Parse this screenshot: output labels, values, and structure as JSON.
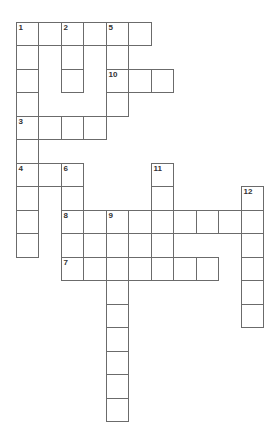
{
  "puzzle": {
    "origin": {
      "x": 16,
      "y": 22
    },
    "cell_w": 22.5,
    "cell_h": 23.5,
    "border_color": "#6b6b6b",
    "cells": [
      [
        0,
        0,
        "1"
      ],
      [
        0,
        1,
        ""
      ],
      [
        0,
        2,
        "2"
      ],
      [
        0,
        3,
        ""
      ],
      [
        0,
        4,
        "5"
      ],
      [
        0,
        5,
        ""
      ],
      [
        1,
        0,
        ""
      ],
      [
        1,
        2,
        ""
      ],
      [
        1,
        4,
        ""
      ],
      [
        2,
        0,
        ""
      ],
      [
        2,
        2,
        ""
      ],
      [
        2,
        4,
        "10"
      ],
      [
        2,
        5,
        ""
      ],
      [
        2,
        6,
        ""
      ],
      [
        3,
        0,
        ""
      ],
      [
        3,
        4,
        ""
      ],
      [
        4,
        0,
        "3"
      ],
      [
        4,
        1,
        ""
      ],
      [
        4,
        2,
        ""
      ],
      [
        4,
        3,
        ""
      ],
      [
        5,
        0,
        ""
      ],
      [
        6,
        0,
        "4"
      ],
      [
        6,
        1,
        ""
      ],
      [
        6,
        2,
        "6"
      ],
      [
        6,
        6,
        "11"
      ],
      [
        7,
        0,
        ""
      ],
      [
        7,
        2,
        ""
      ],
      [
        7,
        6,
        ""
      ],
      [
        7,
        10,
        "12"
      ],
      [
        8,
        0,
        ""
      ],
      [
        8,
        2,
        "8"
      ],
      [
        8,
        3,
        ""
      ],
      [
        8,
        4,
        "9"
      ],
      [
        8,
        5,
        ""
      ],
      [
        8,
        6,
        ""
      ],
      [
        8,
        7,
        ""
      ],
      [
        8,
        8,
        ""
      ],
      [
        8,
        9,
        ""
      ],
      [
        8,
        10,
        ""
      ],
      [
        9,
        0,
        ""
      ],
      [
        9,
        2,
        ""
      ],
      [
        9,
        3,
        ""
      ],
      [
        9,
        4,
        ""
      ],
      [
        9,
        5,
        ""
      ],
      [
        9,
        6,
        ""
      ],
      [
        9,
        10,
        ""
      ],
      [
        10,
        2,
        "7"
      ],
      [
        10,
        3,
        ""
      ],
      [
        10,
        4,
        ""
      ],
      [
        10,
        5,
        ""
      ],
      [
        10,
        6,
        ""
      ],
      [
        10,
        7,
        ""
      ],
      [
        10,
        8,
        ""
      ],
      [
        10,
        10,
        ""
      ],
      [
        11,
        4,
        ""
      ],
      [
        11,
        10,
        ""
      ],
      [
        12,
        4,
        ""
      ],
      [
        12,
        10,
        ""
      ],
      [
        13,
        4,
        ""
      ],
      [
        14,
        4,
        ""
      ],
      [
        15,
        4,
        ""
      ],
      [
        16,
        4,
        ""
      ]
    ],
    "clue_numbers": [
      "1",
      "2",
      "3",
      "4",
      "5",
      "6",
      "7",
      "8",
      "9",
      "10",
      "11",
      "12"
    ]
  }
}
